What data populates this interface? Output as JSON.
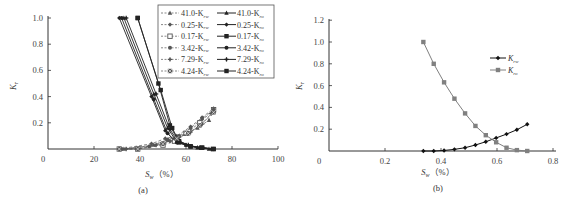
{
  "chart_data": [
    {
      "type": "line",
      "panel_caption": "(a)",
      "xlabel": "S_w (%)",
      "ylabel": "K_r",
      "xlim": [
        0,
        100
      ],
      "ylim": [
        0,
        1.0
      ],
      "xticks": [
        "0",
        "20",
        "40",
        "60",
        "80",
        "100"
      ],
      "yticks": [
        "0.2",
        "0.4",
        "0.6",
        "0.8",
        "1.0"
      ],
      "grid": false,
      "legend_position": "upper right",
      "legend": [
        {
          "label": "41.0-K_rw",
          "style": "dashed",
          "marker": "triangle"
        },
        {
          "label": "41.0-K_ro",
          "style": "solid",
          "marker": "triangle"
        },
        {
          "label": "0.25-K_rw",
          "style": "dashed",
          "marker": "diamond"
        },
        {
          "label": "0.25-K_ro",
          "style": "solid",
          "marker": "diamond"
        },
        {
          "label": "0.17-K_rw",
          "style": "dashed",
          "marker": "open-square"
        },
        {
          "label": "0.17-K_ro",
          "style": "solid",
          "marker": "square"
        },
        {
          "label": "3.42-K_rw",
          "style": "dashed",
          "marker": "circle"
        },
        {
          "label": "3.42-K_ro",
          "style": "solid",
          "marker": "circle"
        },
        {
          "label": "7.29-K_rw",
          "style": "dashed",
          "marker": "star"
        },
        {
          "label": "7.29-K_ro",
          "style": "solid",
          "marker": "star"
        },
        {
          "label": "4.24-K_rw",
          "style": "dashed",
          "marker": "x-square"
        },
        {
          "label": "4.24-K_ro",
          "style": "solid",
          "marker": "square"
        }
      ],
      "series": [
        {
          "name": "41.0-K_ro",
          "x": [
            33,
            46,
            52,
            55,
            60,
            65,
            70
          ],
          "y": [
            1.0,
            0.42,
            0.16,
            0.08,
            0.03,
            0.01,
            0.0
          ]
        },
        {
          "name": "41.0-K_rw",
          "x": [
            33,
            46,
            52,
            56,
            60,
            65,
            70
          ],
          "y": [
            0.0,
            0.03,
            0.07,
            0.09,
            0.12,
            0.16,
            0.22
          ]
        },
        {
          "name": "0.25-K_ro",
          "x": [
            31,
            45,
            51,
            55,
            60,
            66,
            72
          ],
          "y": [
            1.0,
            0.4,
            0.14,
            0.06,
            0.03,
            0.01,
            0.0
          ]
        },
        {
          "name": "0.25-K_rw",
          "x": [
            31,
            45,
            51,
            56,
            62,
            67,
            72
          ],
          "y": [
            0.0,
            0.04,
            0.08,
            0.1,
            0.17,
            0.24,
            0.31
          ]
        },
        {
          "name": "0.17-K_ro",
          "x": [
            39,
            48,
            53,
            57,
            62,
            67,
            72
          ],
          "y": [
            1.0,
            0.5,
            0.18,
            0.05,
            0.02,
            0.01,
            0.0
          ]
        },
        {
          "name": "0.17-K_rw",
          "x": [
            31,
            39,
            50,
            55,
            60,
            66,
            72
          ],
          "y": [
            0.0,
            0.0,
            0.03,
            0.06,
            0.12,
            0.2,
            0.3
          ]
        },
        {
          "name": "3.42-K_ro",
          "x": [
            32,
            46,
            52,
            56,
            62,
            67,
            72
          ],
          "y": [
            1.0,
            0.38,
            0.12,
            0.05,
            0.02,
            0.01,
            0.0
          ]
        },
        {
          "name": "3.42-K_rw",
          "x": [
            32,
            44,
            52,
            57,
            62,
            67,
            72
          ],
          "y": [
            0.0,
            0.02,
            0.07,
            0.1,
            0.16,
            0.23,
            0.3
          ]
        },
        {
          "name": "7.29-K_ro",
          "x": [
            34,
            47,
            53,
            56,
            61,
            66,
            71
          ],
          "y": [
            1.0,
            0.42,
            0.15,
            0.07,
            0.03,
            0.01,
            0.0
          ]
        },
        {
          "name": "7.29-K_rw",
          "x": [
            34,
            47,
            53,
            57,
            62,
            67,
            71
          ],
          "y": [
            0.0,
            0.03,
            0.06,
            0.09,
            0.13,
            0.19,
            0.27
          ]
        },
        {
          "name": "4.24-K_ro",
          "x": [
            39,
            49,
            54,
            57,
            62,
            67,
            72
          ],
          "y": [
            1.0,
            0.45,
            0.16,
            0.06,
            0.02,
            0.01,
            0.0
          ]
        },
        {
          "name": "4.24-K_rw",
          "x": [
            31,
            39,
            50,
            56,
            61,
            66,
            72
          ],
          "y": [
            0.0,
            0.0,
            0.04,
            0.08,
            0.12,
            0.18,
            0.28
          ]
        }
      ]
    },
    {
      "type": "line",
      "panel_caption": "(b)",
      "xlabel": "S_w (%)",
      "ylabel": "K_r",
      "xlim": [
        0,
        0.8
      ],
      "ylim": [
        0,
        1.2
      ],
      "xticks": [
        "0",
        "0.2",
        "0.4",
        "0.6",
        "0.8"
      ],
      "yticks": [
        "0.2",
        "0.4",
        "0.6",
        "0.8",
        "1.0",
        "1.2"
      ],
      "grid": false,
      "legend_position": "right",
      "legend": [
        {
          "label": "K_rw",
          "marker": "diamond",
          "color": "#111111"
        },
        {
          "label": "K_ro",
          "marker": "square",
          "color": "#808080"
        }
      ],
      "x": [
        0.337,
        0.374,
        0.411,
        0.448,
        0.486,
        0.523,
        0.56,
        0.597,
        0.634,
        0.671,
        0.708
      ],
      "series": [
        {
          "name": "K_rw",
          "values": [
            0.0,
            0.0,
            0.005,
            0.015,
            0.03,
            0.055,
            0.085,
            0.12,
            0.155,
            0.195,
            0.245
          ]
        },
        {
          "name": "K_ro",
          "values": [
            1.0,
            0.8,
            0.63,
            0.48,
            0.345,
            0.23,
            0.145,
            0.08,
            0.03,
            0.008,
            0.0
          ]
        }
      ]
    }
  ],
  "labels": {
    "a": {
      "ylabel": "K",
      "ylabel_sub": "r",
      "xlabel": "S",
      "xlabel_sub": "w",
      "xlabel_unit": "（%）",
      "caption": "(a)",
      "xticks": [
        "0",
        "20",
        "40",
        "60",
        "80",
        "100"
      ],
      "yticks": [
        "0.2",
        "0.4",
        "0.6",
        "0.8",
        "1.0"
      ],
      "legend_left": [
        "41.0-K",
        "0.25-K",
        "0.17-K",
        "3.42-K",
        "7.29-K",
        "4.24-K"
      ],
      "legend_left_sub": "rw",
      "legend_right": [
        "41.0-K",
        "0.25-K",
        "0.17-K",
        "3.42-K",
        "7.29-K",
        "4.24-K"
      ],
      "legend_right_sub": "ro"
    },
    "b": {
      "ylabel": "K",
      "ylabel_sub": "r",
      "xlabel": "S",
      "xlabel_sub": "w",
      "xlabel_unit": "（%）",
      "caption": "(b)",
      "xticks": [
        "0",
        "0.2",
        "0.4",
        "0.6",
        "0.8"
      ],
      "yticks": [
        "0.2",
        "0.4",
        "0.6",
        "0.8",
        "1.0",
        "1.2"
      ],
      "legend": [
        {
          "main": "K",
          "sub": "rw"
        },
        {
          "main": "K",
          "sub": "ro"
        }
      ]
    }
  }
}
